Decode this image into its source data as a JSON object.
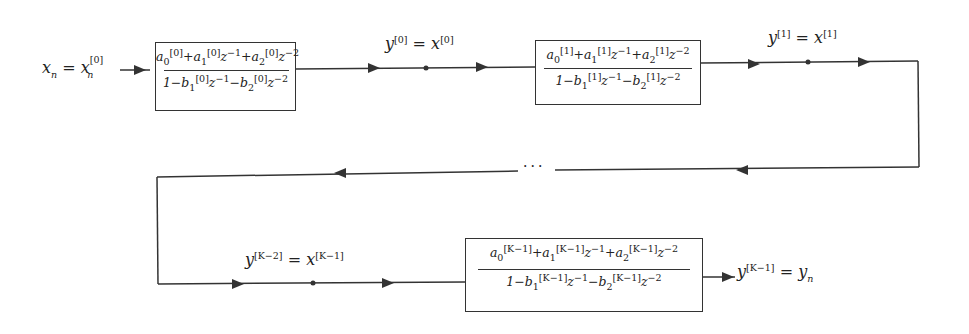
{
  "diagram": {
    "input_label": {
      "lhs": "x",
      "lhs_sub": "n",
      "eq": "=",
      "rhs": "x",
      "rhs_sub": "n",
      "rhs_sup": "[0]"
    },
    "sections": [
      {
        "index": "0",
        "numerator": "a0[0] + a1[0] z^-1 + a2[0] z^-2",
        "denominator": "1 - b1[0] z^-1 - b2[0] z^-2",
        "sup": "[0]"
      },
      {
        "index": "1",
        "numerator": "a0[1] + a1[1] z^-1 + a2[1] z^-2",
        "denominator": "1 - b1[1] z^-1 - b2[1] z^-2",
        "sup": "[1]"
      },
      {
        "index": "K-1",
        "numerator": "a0[K-1] + a1[K-1] z^-1 + a2[K-1] z^-2",
        "denominator": "1 - b1[K-1] z^-1 - b2[K-1] z^-2",
        "sup": "[K−1]"
      }
    ],
    "node_labels": [
      {
        "id": "node-0",
        "y_sup": "[0]",
        "x_sup": "[0]",
        "text": "y_n^[0] = x_n^[0]"
      },
      {
        "id": "node-1",
        "y_sup": "[1]",
        "x_sup": "[1]",
        "text": "y_n^[1] = x_n^[1]"
      },
      {
        "id": "node-k2",
        "y_sup": "[K−2]",
        "x_sup": "[K−1]",
        "text": "y_n^[K-2] = x_n^[K-1]"
      }
    ],
    "output_label": {
      "lhs": "y",
      "lhs_sub": "n",
      "lhs_sup": "[K−1]",
      "eq": "=",
      "rhs": "y",
      "rhs_sub": "n"
    },
    "ellipsis": "···",
    "colors": {
      "line": "#333333",
      "background": "#ffffff"
    }
  }
}
